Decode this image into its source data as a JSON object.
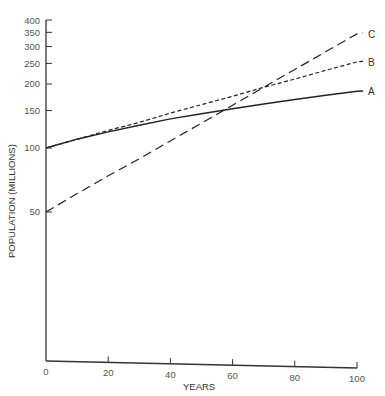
{
  "chart_data": {
    "type": "line",
    "title": "",
    "xlabel": "YEARS",
    "ylabel": "POPULATION (MILLIONS)",
    "yscale": "log",
    "xlim": [
      0,
      100
    ],
    "ylim": [
      10,
      400
    ],
    "grid": false,
    "legend": "inline labels at line ends",
    "x_ticks": [
      0,
      20,
      40,
      60,
      80,
      100
    ],
    "x_tick_labels": [
      "0",
      "20",
      "40",
      "60",
      "80",
      "100"
    ],
    "y_ticks": [
      50,
      100,
      150,
      200,
      250,
      300,
      350,
      400
    ],
    "y_tick_labels": [
      "50",
      "100",
      "150",
      "200",
      "250",
      "300",
      "350",
      "400"
    ],
    "x": [
      0,
      10,
      20,
      30,
      40,
      50,
      60,
      70,
      80,
      90,
      100
    ],
    "series": [
      {
        "name": "A",
        "style": "solid",
        "values": [
          100,
          110,
          119,
          128,
          137,
          145,
          153,
          161,
          169,
          177,
          185
        ]
      },
      {
        "name": "B",
        "style": "short-dash",
        "values": [
          100,
          110,
          121,
          132,
          146,
          160,
          175,
          193,
          211,
          232,
          254
        ]
      },
      {
        "name": "C",
        "style": "long-dash",
        "values": [
          50,
          61,
          74,
          89,
          108,
          131,
          159,
          193,
          234,
          284,
          344
        ]
      }
    ]
  },
  "labels": {
    "series_A": "A",
    "series_B": "B",
    "series_C": "C",
    "x_axis_title": "YEARS",
    "y_axis_title": "POPULATION (MILLIONS)"
  },
  "colors": {
    "line": "#222222",
    "axis": "#333333",
    "text": "#555555"
  }
}
